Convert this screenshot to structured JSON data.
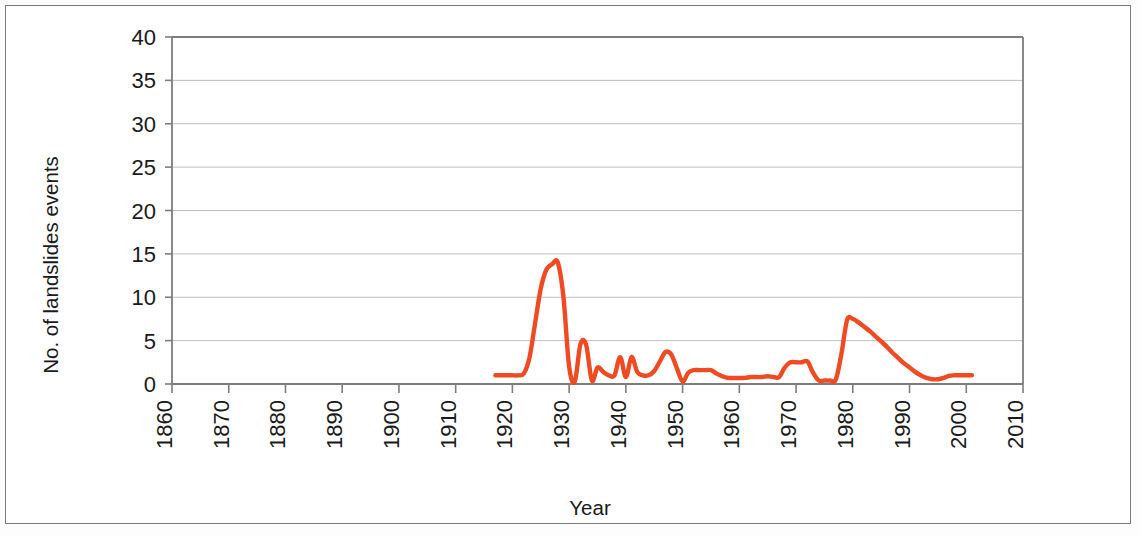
{
  "chart_data": {
    "type": "line",
    "title": "",
    "xlabel": "Year",
    "ylabel": "No. of landslides events",
    "xlim": [
      1860,
      2010
    ],
    "ylim": [
      0,
      40
    ],
    "xticks": [
      "1860",
      "1870",
      "1880",
      "1890",
      "1900",
      "1910",
      "1920",
      "1930",
      "1940",
      "1950",
      "1960",
      "1970",
      "1980",
      "1990",
      "2000",
      "2010"
    ],
    "yticks": [
      "0",
      "5",
      "10",
      "15",
      "20",
      "25",
      "30",
      "35",
      "40"
    ],
    "grid": "horizontal",
    "legend": "none",
    "line_color": "#F04A23",
    "line_width": 4.4,
    "series": [
      {
        "name": "No. of landslides events",
        "x": [
          1917,
          1918,
          1919,
          1920,
          1921,
          1922,
          1923,
          1924,
          1925,
          1926,
          1927,
          1928,
          1929,
          1930,
          1931,
          1932,
          1933,
          1934,
          1935,
          1936,
          1937,
          1938,
          1939,
          1940,
          1941,
          1942,
          1943,
          1944,
          1945,
          1946,
          1947,
          1948,
          1949,
          1950,
          1951,
          1952,
          1953,
          1954,
          1955,
          1956,
          1957,
          1958,
          1959,
          1960,
          1961,
          1962,
          1963,
          1964,
          1965,
          1966,
          1967,
          1968,
          1969,
          1970,
          1971,
          1972,
          1973,
          1974,
          1975,
          1976,
          1977,
          1978,
          1979,
          1980,
          1981,
          1982,
          1983,
          1984,
          1985,
          1986,
          1987,
          1988,
          1989,
          1990,
          1991,
          1992,
          1993,
          1994,
          1995,
          1996,
          1997,
          1998,
          1999,
          2000,
          2001
        ],
        "values": [
          1,
          1,
          1,
          1,
          1,
          1.2,
          3,
          7,
          11,
          13.2,
          13.8,
          14,
          10,
          2,
          0.3,
          4.6,
          4.5,
          0.4,
          1.9,
          1.4,
          1,
          1,
          3.1,
          0.8,
          3.1,
          1.4,
          1,
          1,
          1.5,
          2.6,
          3.7,
          3.4,
          1.8,
          0.3,
          1.3,
          1.6,
          1.6,
          1.6,
          1.6,
          1.2,
          0.9,
          0.7,
          0.7,
          0.7,
          0.7,
          0.8,
          0.8,
          0.8,
          0.9,
          0.8,
          0.8,
          1.9,
          2.5,
          2.5,
          2.5,
          2.6,
          1.3,
          0.4,
          0.4,
          0.4,
          0.5,
          3.5,
          7.4,
          7.5,
          7.1,
          6.6,
          6.1,
          5.5,
          4.9,
          4.3,
          3.6,
          3,
          2.4,
          1.9,
          1.4,
          1,
          0.7,
          0.55,
          0.55,
          0.7,
          0.95,
          1,
          1,
          1,
          1
        ]
      }
    ]
  },
  "axes": {
    "ylabel": "No. of landslides events",
    "xlabel": "Year"
  }
}
